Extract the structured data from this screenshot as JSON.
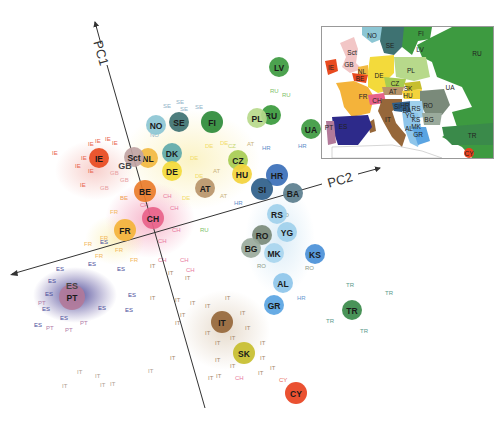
{
  "chart_data": {
    "type": "scatter",
    "title": "",
    "xlabel": "PC2",
    "ylabel": "PC1",
    "grid": false,
    "legend": "inset map of Europe (top-right) coloring each country",
    "axes": {
      "pc1": {
        "label": "PC1",
        "from": [
          205,
          408
        ],
        "to": [
          94,
          19
        ]
      },
      "pc2": {
        "label": "PC2",
        "from": [
          10,
          275
        ],
        "to": [
          382,
          167
        ]
      }
    },
    "series": [
      {
        "code": "FI",
        "color": "#2e8b3a",
        "x": 212,
        "y": 122,
        "r": 11
      },
      {
        "code": "LV",
        "color": "#3d9a40",
        "x": 279,
        "y": 67,
        "r": 10
      },
      {
        "code": "RU",
        "color": "#3a9a3c",
        "x": 271,
        "y": 115,
        "r": 10
      },
      {
        "code": "PL",
        "color": "#b7d98b",
        "x": 257,
        "y": 118,
        "r": 10
      },
      {
        "code": "UA",
        "color": "#3d9a40",
        "x": 311,
        "y": 129,
        "r": 10
      },
      {
        "code": "NO",
        "color": "#8cc6d4",
        "x": 156,
        "y": 125,
        "r": 10
      },
      {
        "code": "SE",
        "color": "#3e7272",
        "x": 179,
        "y": 122,
        "r": 10
      },
      {
        "code": "DK",
        "color": "#5fa9aa",
        "x": 172,
        "y": 153,
        "r": 10
      },
      {
        "code": "DE",
        "color": "#f3da3b",
        "x": 172,
        "y": 171,
        "r": 10
      },
      {
        "code": "NL",
        "color": "#f2b940",
        "x": 148,
        "y": 158,
        "r": 10
      },
      {
        "code": "Sct",
        "color": "#c0a3a3",
        "x": 134,
        "y": 157,
        "r": 10
      },
      {
        "code": "GB",
        "color": "#f2c6c6",
        "x": 125,
        "y": 166,
        "r": 0
      },
      {
        "code": "IE",
        "color": "#e84a1f",
        "x": 99,
        "y": 158,
        "r": 10
      },
      {
        "code": "BE",
        "color": "#ea7c2a",
        "x": 145,
        "y": 191,
        "r": 11
      },
      {
        "code": "CH",
        "color": "#e8628a",
        "x": 153,
        "y": 218,
        "r": 11
      },
      {
        "code": "FR",
        "color": "#f4b33a",
        "x": 125,
        "y": 230,
        "r": 11
      },
      {
        "code": "AT",
        "color": "#b8956a",
        "x": 205,
        "y": 188,
        "r": 10
      },
      {
        "code": "CZ",
        "color": "#a7cc52",
        "x": 238,
        "y": 160,
        "r": 10
      },
      {
        "code": "HU",
        "color": "#f3d33b",
        "x": 242,
        "y": 174,
        "r": 10
      },
      {
        "code": "HR",
        "color": "#3a6fb8",
        "x": 277,
        "y": 175,
        "r": 11
      },
      {
        "code": "SI",
        "color": "#2e5e8a",
        "x": 262,
        "y": 189,
        "r": 11
      },
      {
        "code": "BA",
        "color": "#5b7e8e",
        "x": 293,
        "y": 193,
        "r": 10
      },
      {
        "code": "RS",
        "color": "#9fd0ec",
        "x": 277,
        "y": 214,
        "r": 10
      },
      {
        "code": "YG",
        "color": "#9fd0ec",
        "x": 287,
        "y": 232,
        "r": 10
      },
      {
        "code": "RO",
        "color": "#7a8a7a",
        "x": 262,
        "y": 235,
        "r": 10
      },
      {
        "code": "BG",
        "color": "#9aaa9c",
        "x": 251,
        "y": 248,
        "r": 10
      },
      {
        "code": "MK",
        "color": "#a8d5ee",
        "x": 274,
        "y": 253,
        "r": 10
      },
      {
        "code": "KS",
        "color": "#4a90d8",
        "x": 315,
        "y": 254,
        "r": 10
      },
      {
        "code": "AL",
        "color": "#8ec5ea",
        "x": 283,
        "y": 283,
        "r": 10
      },
      {
        "code": "GR",
        "color": "#5aa4e2",
        "x": 274,
        "y": 305,
        "r": 10
      },
      {
        "code": "PT",
        "color": "#b27a9a",
        "x": 72,
        "y": 297,
        "r": 13
      },
      {
        "code": "ES",
        "color": "#2d2a8a",
        "x": 72,
        "y": 286,
        "r": 0
      },
      {
        "code": "IT",
        "color": "#96673a",
        "x": 222,
        "y": 322,
        "r": 11
      },
      {
        "code": "SK",
        "color": "#c7be2e",
        "x": 244,
        "y": 353,
        "r": 11
      },
      {
        "code": "TR",
        "color": "#3a8a4a",
        "x": 352,
        "y": 310,
        "r": 10
      },
      {
        "code": "CY",
        "color": "#e8421f",
        "x": 296,
        "y": 393,
        "r": 11
      }
    ],
    "sample_labels": [
      {
        "t": "SE",
        "c": "#8fb3c8",
        "x": 163,
        "y": 108
      },
      {
        "t": "SE",
        "c": "#8fb3c8",
        "x": 176,
        "y": 104
      },
      {
        "t": "SE",
        "c": "#8fb3c8",
        "x": 195,
        "y": 109
      },
      {
        "t": "SE",
        "c": "#8fb3c8",
        "x": 180,
        "y": 111
      },
      {
        "t": "NO",
        "c": "#8fb3c8",
        "x": 150,
        "y": 137
      },
      {
        "t": "IE",
        "c": "#e8624a",
        "x": 52,
        "y": 155
      },
      {
        "t": "IE",
        "c": "#e8624a",
        "x": 88,
        "y": 146
      },
      {
        "t": "IE",
        "c": "#e8624a",
        "x": 95,
        "y": 143
      },
      {
        "t": "IE",
        "c": "#e8624a",
        "x": 105,
        "y": 141
      },
      {
        "t": "IE",
        "c": "#e8624a",
        "x": 112,
        "y": 145
      },
      {
        "t": "IE",
        "c": "#e8624a",
        "x": 81,
        "y": 160
      },
      {
        "t": "IE",
        "c": "#e8624a",
        "x": 75,
        "y": 168
      },
      {
        "t": "IE",
        "c": "#e8624a",
        "x": 88,
        "y": 173
      },
      {
        "t": "IE",
        "c": "#e8624a",
        "x": 80,
        "y": 187
      },
      {
        "t": "GB",
        "c": "#e8a0a0",
        "x": 110,
        "y": 175
      },
      {
        "t": "GB",
        "c": "#e8a0a0",
        "x": 120,
        "y": 182
      },
      {
        "t": "GB",
        "c": "#e8a0a0",
        "x": 100,
        "y": 190
      },
      {
        "t": "DE",
        "c": "#f2dc6a",
        "x": 190,
        "y": 160
      },
      {
        "t": "DE",
        "c": "#f2dc6a",
        "x": 205,
        "y": 148
      },
      {
        "t": "DE",
        "c": "#f2dc6a",
        "x": 220,
        "y": 145
      },
      {
        "t": "DE",
        "c": "#f2dc6a",
        "x": 195,
        "y": 178
      },
      {
        "t": "DE",
        "c": "#f2dc6a",
        "x": 182,
        "y": 200
      },
      {
        "t": "DE",
        "c": "#f2dc6a",
        "x": 210,
        "y": 130
      },
      {
        "t": "CZ",
        "c": "#c6d870",
        "x": 228,
        "y": 148
      },
      {
        "t": "AT",
        "c": "#c9b37a",
        "x": 247,
        "y": 146
      },
      {
        "t": "AT",
        "c": "#c9b37a",
        "x": 213,
        "y": 173
      },
      {
        "t": "AT",
        "c": "#c9b37a",
        "x": 220,
        "y": 198
      },
      {
        "t": "HR",
        "c": "#5e8cc8",
        "x": 262,
        "y": 150
      },
      {
        "t": "HR",
        "c": "#5e8cc8",
        "x": 298,
        "y": 148
      },
      {
        "t": "HR",
        "c": "#5e8cc8",
        "x": 234,
        "y": 205
      },
      {
        "t": "RU",
        "c": "#7cbf6a",
        "x": 270,
        "y": 93
      },
      {
        "t": "RU",
        "c": "#7cbf6a",
        "x": 282,
        "y": 97
      },
      {
        "t": "RU",
        "c": "#7cbf6a",
        "x": 200,
        "y": 232
      },
      {
        "t": "CH",
        "c": "#e87aa0",
        "x": 163,
        "y": 198
      },
      {
        "t": "CH",
        "c": "#e87aa0",
        "x": 170,
        "y": 210
      },
      {
        "t": "CH",
        "c": "#e87aa0",
        "x": 140,
        "y": 207
      },
      {
        "t": "CH",
        "c": "#e87aa0",
        "x": 172,
        "y": 232
      },
      {
        "t": "CH",
        "c": "#e87aa0",
        "x": 158,
        "y": 243
      },
      {
        "t": "CH",
        "c": "#e87aa0",
        "x": 180,
        "y": 262
      },
      {
        "t": "CH",
        "c": "#e87aa0",
        "x": 186,
        "y": 272
      },
      {
        "t": "CH",
        "c": "#e87aa0",
        "x": 158,
        "y": 262
      },
      {
        "t": "FR",
        "c": "#f2b85a",
        "x": 110,
        "y": 214
      },
      {
        "t": "FR",
        "c": "#f2b85a",
        "x": 100,
        "y": 240
      },
      {
        "t": "FR",
        "c": "#f2b85a",
        "x": 115,
        "y": 252
      },
      {
        "t": "FR",
        "c": "#f2b85a",
        "x": 84,
        "y": 246
      },
      {
        "t": "FR",
        "c": "#f2b85a",
        "x": 95,
        "y": 258
      },
      {
        "t": "FR",
        "c": "#f2b85a",
        "x": 130,
        "y": 262
      },
      {
        "t": "BE",
        "c": "#ef9a50",
        "x": 120,
        "y": 200
      },
      {
        "t": "ES",
        "c": "#4a4a9a",
        "x": 100,
        "y": 244
      },
      {
        "t": "ES",
        "c": "#4a4a9a",
        "x": 56,
        "y": 271
      },
      {
        "t": "ES",
        "c": "#4a4a9a",
        "x": 88,
        "y": 266
      },
      {
        "t": "ES",
        "c": "#4a4a9a",
        "x": 117,
        "y": 271
      },
      {
        "t": "ES",
        "c": "#4a4a9a",
        "x": 48,
        "y": 283
      },
      {
        "t": "ES",
        "c": "#4a4a9a",
        "x": 45,
        "y": 296
      },
      {
        "t": "ES",
        "c": "#4a4a9a",
        "x": 42,
        "y": 311
      },
      {
        "t": "ES",
        "c": "#4a4a9a",
        "x": 98,
        "y": 310
      },
      {
        "t": "ES",
        "c": "#4a4a9a",
        "x": 125,
        "y": 312
      },
      {
        "t": "ES",
        "c": "#4a4a9a",
        "x": 34,
        "y": 327
      },
      {
        "t": "ES",
        "c": "#4a4a9a",
        "x": 60,
        "y": 320
      },
      {
        "t": "ES",
        "c": "#4a4a9a",
        "x": 128,
        "y": 297
      },
      {
        "t": "PT",
        "c": "#b07aa8",
        "x": 38,
        "y": 305
      },
      {
        "t": "PT",
        "c": "#b07aa8",
        "x": 46,
        "y": 330
      },
      {
        "t": "PT",
        "c": "#b07aa8",
        "x": 80,
        "y": 325
      },
      {
        "t": "PT",
        "c": "#b07aa8",
        "x": 65,
        "y": 332
      },
      {
        "t": "IT",
        "c": "#a88a6a",
        "x": 150,
        "y": 268
      },
      {
        "t": "IT",
        "c": "#a88a6a",
        "x": 168,
        "y": 275
      },
      {
        "t": "IT",
        "c": "#a88a6a",
        "x": 185,
        "y": 280
      },
      {
        "t": "IT",
        "c": "#a88a6a",
        "x": 150,
        "y": 300
      },
      {
        "t": "IT",
        "c": "#a88a6a",
        "x": 175,
        "y": 302
      },
      {
        "t": "IT",
        "c": "#a88a6a",
        "x": 190,
        "y": 305
      },
      {
        "t": "IT",
        "c": "#a88a6a",
        "x": 205,
        "y": 308
      },
      {
        "t": "IT",
        "c": "#a88a6a",
        "x": 225,
        "y": 300
      },
      {
        "t": "IT",
        "c": "#a88a6a",
        "x": 240,
        "y": 315
      },
      {
        "t": "IT",
        "c": "#a88a6a",
        "x": 245,
        "y": 330
      },
      {
        "t": "IT",
        "c": "#a88a6a",
        "x": 205,
        "y": 335
      },
      {
        "t": "IT",
        "c": "#a88a6a",
        "x": 215,
        "y": 345
      },
      {
        "t": "IT",
        "c": "#a88a6a",
        "x": 230,
        "y": 340
      },
      {
        "t": "IT",
        "c": "#a88a6a",
        "x": 260,
        "y": 345
      },
      {
        "t": "IT",
        "c": "#a88a6a",
        "x": 260,
        "y": 360
      },
      {
        "t": "IT",
        "c": "#a88a6a",
        "x": 230,
        "y": 368
      },
      {
        "t": "IT",
        "c": "#a88a6a",
        "x": 215,
        "y": 362
      },
      {
        "t": "IT",
        "c": "#a88a6a",
        "x": 180,
        "y": 317
      },
      {
        "t": "IT",
        "c": "#a88a6a",
        "x": 175,
        "y": 325
      },
      {
        "t": "IT",
        "c": "#a88a6a",
        "x": 216,
        "y": 378
      },
      {
        "t": "IT",
        "c": "#a88a6a",
        "x": 208,
        "y": 380
      },
      {
        "t": "IT",
        "c": "#a88a6a",
        "x": 170,
        "y": 360
      },
      {
        "t": "IT",
        "c": "#a88a6a",
        "x": 258,
        "y": 375
      },
      {
        "t": "IT",
        "c": "#a88a6a",
        "x": 270,
        "y": 370
      },
      {
        "t": "IT",
        "c": "#b0a090",
        "x": 77,
        "y": 374
      },
      {
        "t": "IT",
        "c": "#b0a090",
        "x": 95,
        "y": 378
      },
      {
        "t": "IT",
        "c": "#b0a090",
        "x": 62,
        "y": 388
      },
      {
        "t": "IT",
        "c": "#b0a090",
        "x": 100,
        "y": 387
      },
      {
        "t": "IT",
        "c": "#b0a090",
        "x": 110,
        "y": 386
      },
      {
        "t": "IT",
        "c": "#b0a090",
        "x": 148,
        "y": 373
      },
      {
        "t": "CH",
        "c": "#e87aa0",
        "x": 235,
        "y": 380
      },
      {
        "t": "RO",
        "c": "#8a9a8a",
        "x": 280,
        "y": 217
      },
      {
        "t": "RO",
        "c": "#8a9a8a",
        "x": 285,
        "y": 235
      },
      {
        "t": "RO",
        "c": "#8a9a8a",
        "x": 257,
        "y": 268
      },
      {
        "t": "RO",
        "c": "#8a9a8a",
        "x": 305,
        "y": 270
      },
      {
        "t": "HR",
        "c": "#6a9ad0",
        "x": 297,
        "y": 300
      },
      {
        "t": "TR",
        "c": "#5a9a8a",
        "x": 346,
        "y": 287
      },
      {
        "t": "TR",
        "c": "#5a9a8a",
        "x": 385,
        "y": 295
      },
      {
        "t": "TR",
        "c": "#5a9a8a",
        "x": 326,
        "y": 323
      },
      {
        "t": "TR",
        "c": "#5a9a8a",
        "x": 360,
        "y": 333
      },
      {
        "t": "CY",
        "c": "#e86a5a",
        "x": 279,
        "y": 382
      }
    ],
    "inset_map": {
      "title": "Europe",
      "labels": [
        "NO",
        "SE",
        "FI",
        "LV",
        "RU",
        "Sct",
        "GB",
        "IE",
        "NL",
        "BE",
        "DE",
        "PL",
        "CZ",
        "SK",
        "AT",
        "HU",
        "UA",
        "FR",
        "CH",
        "RO",
        "SI",
        "HR",
        "BA",
        "RS",
        "YG",
        "IT",
        "KS",
        "BG",
        "MK",
        "AL",
        "GR",
        "ES",
        "PT",
        "TR",
        "CY"
      ]
    }
  },
  "axes_labels": {
    "pc1": "PC1",
    "pc2": "PC2"
  },
  "inset": {
    "regions": [
      {
        "code": "NO",
        "x": 50,
        "y": 8
      },
      {
        "code": "SE",
        "x": 68,
        "y": 18
      },
      {
        "code": "FI",
        "x": 99,
        "y": 6
      },
      {
        "code": "LV",
        "x": 98,
        "y": 22
      },
      {
        "code": "RU",
        "x": 155,
        "y": 26
      },
      {
        "code": "Sct",
        "x": 30,
        "y": 25
      },
      {
        "code": "GB",
        "x": 27,
        "y": 37
      },
      {
        "code": "IE",
        "x": 9,
        "y": 40
      },
      {
        "code": "NL",
        "x": 40,
        "y": 44
      },
      {
        "code": "BE",
        "x": 38,
        "y": 51
      },
      {
        "code": "DE",
        "x": 57,
        "y": 48
      },
      {
        "code": "PL",
        "x": 89,
        "y": 43
      },
      {
        "code": "CZ",
        "x": 73,
        "y": 56
      },
      {
        "code": "SK",
        "x": 86,
        "y": 61
      },
      {
        "code": "AT",
        "x": 71,
        "y": 64
      },
      {
        "code": "HU",
        "x": 86,
        "y": 68
      },
      {
        "code": "UA",
        "x": 128,
        "y": 60
      },
      {
        "code": "FR",
        "x": 41,
        "y": 69
      },
      {
        "code": "CH",
        "x": 55,
        "y": 73
      },
      {
        "code": "RO",
        "x": 106,
        "y": 78
      },
      {
        "code": "SI",
        "x": 75,
        "y": 79
      },
      {
        "code": "HR",
        "x": 83,
        "y": 78
      },
      {
        "code": "BA",
        "x": 85,
        "y": 83
      },
      {
        "code": "RS",
        "x": 94,
        "y": 81
      },
      {
        "code": "YG",
        "x": 88,
        "y": 88
      },
      {
        "code": "IT",
        "x": 66,
        "y": 92
      },
      {
        "code": "KS",
        "x": 94,
        "y": 92
      },
      {
        "code": "BG",
        "x": 107,
        "y": 92
      },
      {
        "code": "MK",
        "x": 94,
        "y": 99
      },
      {
        "code": "AL",
        "x": 87,
        "y": 101
      },
      {
        "code": "GR",
        "x": 96,
        "y": 107
      },
      {
        "code": "ES",
        "x": 21,
        "y": 99
      },
      {
        "code": "PT",
        "x": 7,
        "y": 100
      },
      {
        "code": "TR",
        "x": 150,
        "y": 108
      },
      {
        "code": "CY",
        "x": 147,
        "y": 126
      }
    ]
  }
}
